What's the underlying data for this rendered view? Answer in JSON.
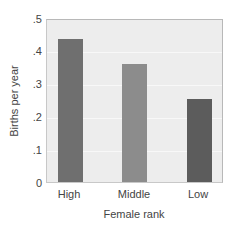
{
  "chart_data": {
    "type": "bar",
    "title": "",
    "xlabel": "Female rank",
    "ylabel": "Births per year",
    "categories": [
      "High",
      "Middle",
      "Low"
    ],
    "values": [
      0.44,
      0.365,
      0.255
    ],
    "ylim": [
      0,
      0.5
    ],
    "yticks": [
      "0",
      ".1",
      ".2",
      ".3",
      ".4",
      ".5"
    ],
    "grid": true,
    "legend": null,
    "bar_colors": [
      "#6f6f6f",
      "#8c8c8c",
      "#5c5c5c"
    ]
  },
  "axes": {
    "xlabel": "Female rank",
    "ylabel": "Births per year",
    "yticks": [
      {
        "label": "0",
        "value": 0
      },
      {
        "label": ".1",
        "value": 0.1
      },
      {
        "label": ".2",
        "value": 0.2
      },
      {
        "label": ".3",
        "value": 0.3
      },
      {
        "label": ".4",
        "value": 0.4
      },
      {
        "label": ".5",
        "value": 0.5
      }
    ],
    "xticks": [
      "High",
      "Middle",
      "Low"
    ]
  },
  "colors": {
    "plot_background": "#ededed",
    "gridline": "#f8f8f8",
    "bar_high": "#6f6f6f",
    "bar_middle": "#8c8c8c",
    "bar_low": "#5c5c5c"
  }
}
